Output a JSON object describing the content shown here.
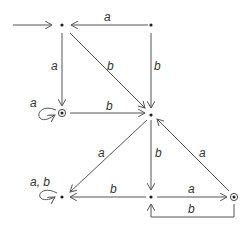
{
  "diagram": {
    "type": "finite-automaton",
    "states": [
      {
        "id": "s1",
        "x": 62,
        "y": 25,
        "initial": true,
        "accepting": false
      },
      {
        "id": "s2",
        "x": 151,
        "y": 25,
        "initial": false,
        "accepting": false
      },
      {
        "id": "s3",
        "x": 62,
        "y": 113,
        "initial": false,
        "accepting": true
      },
      {
        "id": "s4",
        "x": 151,
        "y": 115,
        "initial": false,
        "accepting": false
      },
      {
        "id": "s5",
        "x": 62,
        "y": 197,
        "initial": false,
        "accepting": false
      },
      {
        "id": "s6",
        "x": 151,
        "y": 197,
        "initial": false,
        "accepting": false
      },
      {
        "id": "s7",
        "x": 234,
        "y": 197,
        "initial": false,
        "accepting": true
      }
    ],
    "labels": {
      "s2_s1": "a",
      "s1_s3": "a",
      "s1_s4": "b",
      "s2_s4": "b",
      "s3_loop": "a",
      "s3_s4": "b",
      "s4_s5": "a",
      "s4_s6": "b",
      "s7_s4": "a",
      "s6_s5": "b",
      "s6_s7": "a",
      "s7_s6": "b",
      "s5_loop": "a, b"
    }
  }
}
